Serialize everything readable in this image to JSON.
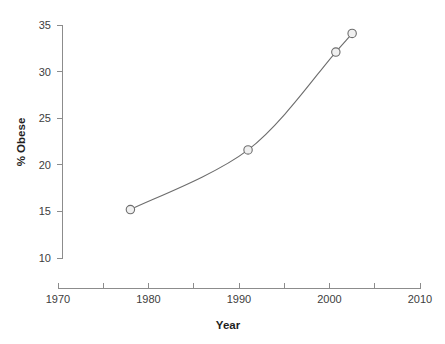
{
  "chart_data": {
    "type": "line",
    "title": "",
    "subtitle": "",
    "xlabel": "Year",
    "ylabel": "% Obese",
    "xlim": [
      1970,
      2010
    ],
    "ylim": [
      10,
      35
    ],
    "grid": false,
    "legend": null,
    "x_major_ticks": [
      1970,
      1980,
      1990,
      2000,
      2010
    ],
    "x_minor_ticks": [
      1975,
      1985,
      1995,
      2005
    ],
    "x_tick_labels": [
      "1970",
      "1980",
      "1990",
      "2000",
      "2010"
    ],
    "y_ticks": [
      10,
      15,
      20,
      25,
      30,
      35
    ],
    "y_tick_labels": [
      "10",
      "15",
      "20",
      "25",
      "30",
      "35"
    ],
    "marker": "open-circle",
    "series": [
      {
        "name": "% Obese",
        "x": [
          1978,
          1991,
          2000.7,
          2002.5
        ],
        "values": [
          15.2,
          21.6,
          32.1,
          34.1
        ],
        "points": [
          {
            "x": 1978,
            "y": 15.2
          },
          {
            "x": 1991,
            "y": 21.6
          },
          {
            "x": 2000.7,
            "y": 32.1
          },
          {
            "x": 2002.5,
            "y": 34.1
          }
        ]
      }
    ],
    "colors": {
      "line": "#6d6d6d",
      "marker_fill": "#f0f0f0",
      "marker_stroke": "#6d6d6d",
      "axis": "#8c8c8c",
      "text": "#3d3d3d",
      "background": "#ffffff"
    }
  }
}
